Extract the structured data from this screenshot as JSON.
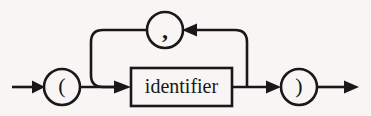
{
  "diagram": {
    "type": "railroad-syntax-diagram",
    "title": "",
    "background_color": "#f7f6f4",
    "stroke_color": "#1a1718",
    "entry": {
      "label": "",
      "arrow_direction": "right"
    },
    "exit": {
      "label": "",
      "arrow_direction": "right"
    },
    "nodes": [
      {
        "id": "open-paren",
        "shape": "circle",
        "kind": "terminal",
        "label": "(",
        "cx": 62,
        "cy": 87,
        "r": 18
      },
      {
        "id": "identifier",
        "shape": "rectangle",
        "kind": "nonterminal",
        "label": "identifier",
        "x": 131,
        "y": 68,
        "width": 101,
        "height": 38
      },
      {
        "id": "comma",
        "shape": "circle",
        "kind": "terminal",
        "label": ",",
        "cx": 165,
        "cy": 30,
        "r": 18
      },
      {
        "id": "close-paren",
        "shape": "circle",
        "kind": "terminal",
        "label": ")",
        "cx": 299,
        "cy": 87,
        "r": 18
      }
    ],
    "connections": [
      {
        "id": "entry-to-open-paren",
        "from": "entry",
        "to": "open-paren",
        "direction": "right",
        "has_arrowhead": true
      },
      {
        "id": "open-paren-to-identifier",
        "from": "open-paren",
        "to": "identifier",
        "direction": "right",
        "has_arrowhead": true
      },
      {
        "id": "identifier-to-close-paren",
        "from": "identifier",
        "to": "close-paren",
        "direction": "right",
        "has_arrowhead": true
      },
      {
        "id": "close-paren-to-exit",
        "from": "close-paren",
        "to": "exit",
        "direction": "right",
        "has_arrowhead": true
      },
      {
        "id": "loop-back-right-up",
        "from": "identifier",
        "to": "comma",
        "direction": "up-then-left",
        "has_arrowhead": true
      },
      {
        "id": "loop-back-left-down",
        "from": "comma",
        "to": "identifier",
        "direction": "left-then-down",
        "has_arrowhead": false
      }
    ],
    "meaning": "A parenthesized list of one or more identifiers separated by commas."
  }
}
